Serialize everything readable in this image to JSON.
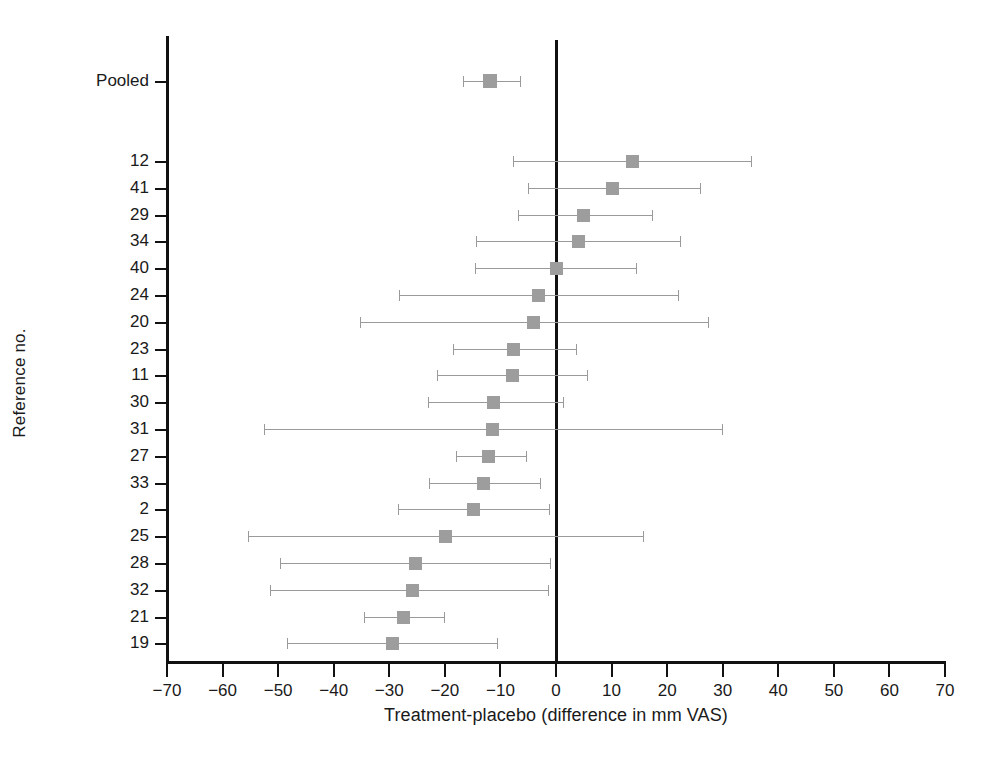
{
  "chart_data": {
    "type": "scatter",
    "subtype": "forest-plot",
    "title": "",
    "xlabel": "Treatment-placebo (difference in mm VAS)",
    "ylabel": "Reference no.",
    "xlim": [
      -70,
      70
    ],
    "xticks": [
      -70,
      -60,
      -50,
      -40,
      -30,
      -20,
      -10,
      0,
      10,
      20,
      30,
      40,
      50,
      60,
      70
    ],
    "xtick_labels": [
      "−70",
      "−60",
      "−50",
      "−40",
      "−30",
      "−20",
      "−10",
      "0",
      "10",
      "20",
      "30",
      "40",
      "50",
      "60",
      "70"
    ],
    "grid": false,
    "legend": null,
    "reference_line": 0,
    "marker_color": "#9d9d9d",
    "ci_color": "#9a9a9a",
    "axis_color": "#111111",
    "pooled": {
      "label": "Pooled",
      "estimate": -11.9,
      "ci_low": -16.7,
      "ci_high": -6.5
    },
    "studies": [
      {
        "label": "12",
        "estimate": 13.7,
        "ci_low": -7.7,
        "ci_high": 35.1
      },
      {
        "label": "41",
        "estimate": 10.1,
        "ci_low": -5.0,
        "ci_high": 25.9
      },
      {
        "label": "29",
        "estimate": 4.9,
        "ci_low": -6.8,
        "ci_high": 17.3
      },
      {
        "label": "34",
        "estimate": 4.0,
        "ci_low": -14.4,
        "ci_high": 22.3
      },
      {
        "label": "40",
        "estimate": 0.0,
        "ci_low": -14.6,
        "ci_high": 14.4
      },
      {
        "label": "24",
        "estimate": -3.2,
        "ci_low": -28.3,
        "ci_high": 22.0
      },
      {
        "label": "20",
        "estimate": -4.1,
        "ci_low": -35.3,
        "ci_high": 27.4
      },
      {
        "label": "23",
        "estimate": -7.7,
        "ci_low": -18.5,
        "ci_high": 3.6
      },
      {
        "label": "11",
        "estimate": -7.9,
        "ci_low": -21.4,
        "ci_high": 5.6
      },
      {
        "label": "30",
        "estimate": -11.2,
        "ci_low": -23.0,
        "ci_high": 1.3
      },
      {
        "label": "31",
        "estimate": -11.5,
        "ci_low": -52.6,
        "ci_high": 29.9
      },
      {
        "label": "27",
        "estimate": -12.1,
        "ci_low": -18.0,
        "ci_high": -5.4
      },
      {
        "label": "33",
        "estimate": -13.0,
        "ci_low": -22.9,
        "ci_high": -2.9
      },
      {
        "label": "2",
        "estimate": -14.9,
        "ci_low": -28.4,
        "ci_high": -1.3
      },
      {
        "label": "25",
        "estimate": -19.8,
        "ci_low": -55.4,
        "ci_high": 15.6
      },
      {
        "label": "28",
        "estimate": -25.2,
        "ci_low": -49.7,
        "ci_high": -1.1
      },
      {
        "label": "32",
        "estimate": -25.8,
        "ci_low": -51.5,
        "ci_high": -1.5
      },
      {
        "label": "21",
        "estimate": -27.4,
        "ci_low": -34.6,
        "ci_high": -20.1
      },
      {
        "label": "19",
        "estimate": -29.4,
        "ci_low": -48.4,
        "ci_high": -10.6
      }
    ]
  }
}
